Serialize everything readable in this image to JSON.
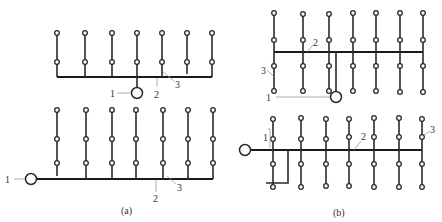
{
  "figure": {
    "panels": [
      {
        "id": "a",
        "caption": "(a)"
      },
      {
        "id": "b",
        "caption": "(b)"
      }
    ],
    "labels": {
      "source": "1",
      "main_pipe": "2",
      "branch_pipe": "3"
    },
    "colors": {
      "line": "#2a2a2a",
      "leader": "#999999",
      "background": "#ffffff"
    }
  },
  "a_top": {
    "label_1": "1",
    "label_2": "2",
    "label_3": "3"
  },
  "a_bottom": {
    "label_1": "1",
    "label_2": "2",
    "label_3": "3",
    "caption": "(a)"
  },
  "b_top": {
    "label_1": "1",
    "label_2": "2",
    "label_3": "3"
  },
  "b_bottom": {
    "label_1": "1",
    "label_2": "2",
    "label_3": "3",
    "caption": "(b)"
  }
}
